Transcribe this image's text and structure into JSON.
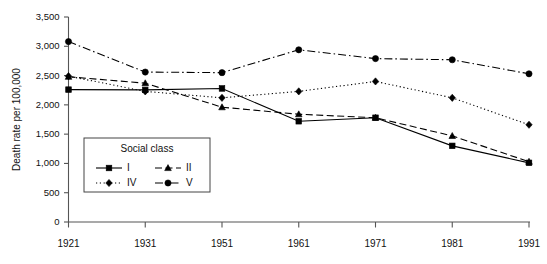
{
  "chart_data": {
    "type": "line",
    "title": "",
    "xlabel": "",
    "ylabel": "Death rate per 100,000",
    "categories": [
      "1921",
      "1931",
      "1951",
      "1961",
      "1971",
      "1981",
      "1991"
    ],
    "x": [
      1921,
      1931,
      1951,
      1961,
      1971,
      1981,
      1991
    ],
    "ylim": [
      0,
      3500
    ],
    "yticks": [
      0,
      500,
      1000,
      1500,
      2000,
      2500,
      3000,
      3500
    ],
    "ytick_labels": [
      "0",
      "500",
      "1,000",
      "1,500",
      "2,000",
      "2,500",
      "3,000",
      "3,500"
    ],
    "grid": false,
    "legend_position": "inside-lower-left",
    "legend_title": "Social class",
    "series": [
      {
        "name": "I",
        "marker": "square",
        "line_style": "solid",
        "color": "#000000",
        "values": [
          2260,
          2255,
          2280,
          1720,
          1780,
          1300,
          1010
        ]
      },
      {
        "name": "II",
        "marker": "triangle",
        "line_style": "dashed",
        "color": "#000000",
        "values": [
          2480,
          2370,
          1960,
          1840,
          1780,
          1470,
          1030
        ]
      },
      {
        "name": "IV",
        "marker": "diamond",
        "line_style": "dotted",
        "color": "#000000",
        "values": [
          2490,
          2230,
          2120,
          2230,
          2400,
          2120,
          1660
        ]
      },
      {
        "name": "V",
        "marker": "circle",
        "line_style": "dashdot",
        "color": "#000000",
        "values": [
          3080,
          2560,
          2550,
          2940,
          2790,
          2770,
          2530
        ]
      }
    ]
  }
}
